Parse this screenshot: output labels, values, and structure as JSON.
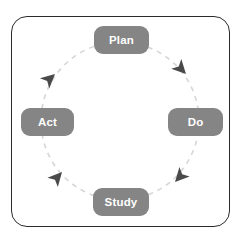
{
  "diagram": {
    "type": "cycle-diagram",
    "direction": "clockwise",
    "frame": {
      "border_color": "#2b2b2b",
      "background": "#ffffff"
    },
    "circle": {
      "style": "dashed",
      "color": "#d6d6d6",
      "center_x": 120,
      "center_y": 121,
      "radius": 79
    },
    "node_color": "#858585",
    "node_text_color": "#ffffff",
    "arrow_color": "#4a4a4a",
    "nodes": [
      {
        "id": "plan",
        "label": "Plan",
        "position": "top"
      },
      {
        "id": "do",
        "label": "Do",
        "position": "right"
      },
      {
        "id": "study",
        "label": "Study",
        "position": "bottom"
      },
      {
        "id": "act",
        "label": "Act",
        "position": "left"
      }
    ],
    "arrows": [
      {
        "id": "arrow-top-right",
        "points": "down-right",
        "between": "Plan to Do"
      },
      {
        "id": "arrow-bottom-right",
        "points": "down-left",
        "between": "Do to Study"
      },
      {
        "id": "arrow-bottom-left",
        "points": "up-right",
        "between": "Study to Act"
      },
      {
        "id": "arrow-top-left",
        "points": "up-right",
        "between": "Act to Plan"
      }
    ]
  }
}
